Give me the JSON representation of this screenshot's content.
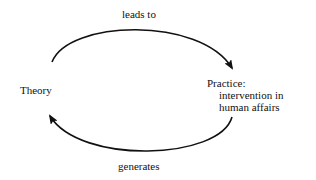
{
  "diagram": {
    "nodes": [
      {
        "id": "theory",
        "label": "Theory"
      },
      {
        "id": "practice",
        "label": "Practice:",
        "sublines": [
          "intervention in",
          "human affairs"
        ]
      }
    ],
    "edges": [
      {
        "from": "theory",
        "to": "practice",
        "label": "leads to"
      },
      {
        "from": "practice",
        "to": "theory",
        "label": "generates"
      }
    ],
    "colors": {
      "stroke": "#111111",
      "background": "#ffffff"
    }
  }
}
